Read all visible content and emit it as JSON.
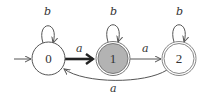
{
  "diagram": {
    "type": "finite-automaton",
    "colors": {
      "stroke": "#555555",
      "text": "#333333",
      "accept_ring": "#888888",
      "highlight_fill": "#b3b3b3",
      "background": "#ffffff"
    },
    "start_state": "0",
    "states": [
      {
        "id": "0",
        "label": "0",
        "accepting": false,
        "highlighted": false
      },
      {
        "id": "1",
        "label": "1",
        "accepting": true,
        "highlighted": true
      },
      {
        "id": "2",
        "label": "2",
        "accepting": true,
        "highlighted": false
      }
    ],
    "transitions": [
      {
        "from": "0",
        "to": "0",
        "symbol": "b",
        "kind": "self-loop"
      },
      {
        "from": "1",
        "to": "1",
        "symbol": "b",
        "kind": "self-loop"
      },
      {
        "from": "2",
        "to": "2",
        "symbol": "b",
        "kind": "self-loop"
      },
      {
        "from": "0",
        "to": "1",
        "symbol": "a",
        "kind": "straight",
        "bold": true
      },
      {
        "from": "1",
        "to": "2",
        "symbol": "a",
        "kind": "straight",
        "bold": false
      },
      {
        "from": "2",
        "to": "0",
        "symbol": "a",
        "kind": "curved-below",
        "bold": false
      }
    ]
  }
}
